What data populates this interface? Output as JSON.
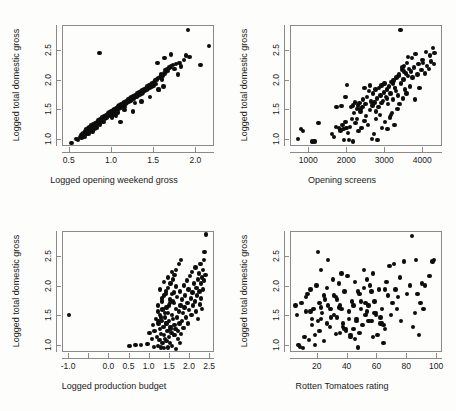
{
  "figure": {
    "type": "scatter-matrix",
    "background_color": "#fdfdfc",
    "point_color": "#0d0d0d",
    "axis_color": "#8a8a8a",
    "rows": 2,
    "cols": 2
  },
  "chart_data": [
    {
      "type": "scatter",
      "panel": 0,
      "title": "",
      "xlabel": "Logged opening weekend gross",
      "ylabel": "Logged total domestic gross",
      "xlim": [
        0.42,
        2.22
      ],
      "ylim": [
        0.88,
        2.92
      ],
      "xticks": [
        0.5,
        1.0,
        1.5,
        2.0
      ],
      "xticklabels": [
        "0.5",
        "1.0",
        "1.5",
        "2.0"
      ],
      "yticks": [
        1.0,
        1.5,
        2.0,
        2.5
      ],
      "yticklabels": [
        "1.0",
        "1.5",
        "2.0",
        "2.5"
      ],
      "grid": false,
      "legend": null,
      "x": [
        0.52,
        0.58,
        0.6,
        0.62,
        0.63,
        0.64,
        0.65,
        0.66,
        0.66,
        0.67,
        0.68,
        0.68,
        0.69,
        0.7,
        0.7,
        0.71,
        0.72,
        0.72,
        0.73,
        0.74,
        0.75,
        0.75,
        0.76,
        0.77,
        0.78,
        0.78,
        0.79,
        0.8,
        0.8,
        0.81,
        0.82,
        0.82,
        0.83,
        0.84,
        0.85,
        0.86,
        0.86,
        0.87,
        0.88,
        0.89,
        0.9,
        0.91,
        0.92,
        0.93,
        0.94,
        0.95,
        0.96,
        0.97,
        0.98,
        0.99,
        1.0,
        1.0,
        1.01,
        1.02,
        1.03,
        1.03,
        1.04,
        1.05,
        1.05,
        1.06,
        1.07,
        1.07,
        1.08,
        1.09,
        1.1,
        1.1,
        1.11,
        1.12,
        1.13,
        1.14,
        1.15,
        1.15,
        1.16,
        1.17,
        1.18,
        1.19,
        1.2,
        1.21,
        1.22,
        1.23,
        1.24,
        1.25,
        1.26,
        1.27,
        1.28,
        1.29,
        1.3,
        1.31,
        1.32,
        1.33,
        1.34,
        1.35,
        1.36,
        1.37,
        1.38,
        1.39,
        1.4,
        1.41,
        1.42,
        1.43,
        1.44,
        1.45,
        1.46,
        1.47,
        1.48,
        1.49,
        1.5,
        1.51,
        1.52,
        1.53,
        1.54,
        1.55,
        1.56,
        1.57,
        1.58,
        1.59,
        1.6,
        1.61,
        1.62,
        1.63,
        1.64,
        1.65,
        1.66,
        1.68,
        1.7,
        1.72,
        1.74,
        1.76,
        1.78,
        1.8,
        1.82,
        1.85,
        1.88,
        1.9,
        1.92,
        2.05,
        2.15,
        0.85,
        0.95,
        1.05,
        1.15,
        1.25,
        1.35,
        1.45,
        1.55,
        1.62,
        1.7
      ],
      "y": [
        0.95,
        1.02,
        1.0,
        1.05,
        1.08,
        1.03,
        1.1,
        1.06,
        1.12,
        1.08,
        1.14,
        1.05,
        1.16,
        1.1,
        1.18,
        1.13,
        1.2,
        1.11,
        1.22,
        1.16,
        1.18,
        1.24,
        1.2,
        1.14,
        1.22,
        1.26,
        1.24,
        1.19,
        1.28,
        1.25,
        1.21,
        1.3,
        1.27,
        1.33,
        1.29,
        1.35,
        1.26,
        1.31,
        1.38,
        1.34,
        1.3,
        1.4,
        1.36,
        1.42,
        1.38,
        1.44,
        1.4,
        1.46,
        1.42,
        1.48,
        1.44,
        1.38,
        1.5,
        1.46,
        1.52,
        1.42,
        1.48,
        1.54,
        1.44,
        1.5,
        1.56,
        1.46,
        1.52,
        1.58,
        1.54,
        1.3,
        1.6,
        1.56,
        1.62,
        1.58,
        1.64,
        1.5,
        1.6,
        1.66,
        1.62,
        1.68,
        1.64,
        1.7,
        1.66,
        1.72,
        1.68,
        1.74,
        1.7,
        1.62,
        1.76,
        1.72,
        1.78,
        1.74,
        1.8,
        1.76,
        1.82,
        1.78,
        1.84,
        1.8,
        1.86,
        1.82,
        1.88,
        1.84,
        1.9,
        1.86,
        1.92,
        1.88,
        1.94,
        1.9,
        1.96,
        1.92,
        1.98,
        2.0,
        1.94,
        2.02,
        2.3,
        2.04,
        1.84,
        2.06,
        2.1,
        2.02,
        2.08,
        1.9,
        2.12,
        2.18,
        2.14,
        2.2,
        2.16,
        2.22,
        2.24,
        2.26,
        2.2,
        2.28,
        2.1,
        2.3,
        2.24,
        2.35,
        2.42,
        2.85,
        2.4,
        2.26,
        2.58,
        2.46,
        1.45,
        1.4,
        1.55,
        1.48,
        1.65,
        1.72,
        1.85,
        2.38,
        2.44,
        2.32
      ]
    },
    {
      "type": "scatter",
      "panel": 1,
      "title": "",
      "xlabel": "Opening screens",
      "ylabel": "Logged total domestic gross",
      "xlim": [
        520,
        4520
      ],
      "ylim": [
        0.88,
        2.92
      ],
      "xticks": [
        1000,
        2000,
        3000,
        4000
      ],
      "xticklabels": [
        "1000",
        "2000",
        "3000",
        "4000"
      ],
      "yticks": [
        1.0,
        1.5,
        2.0,
        2.5
      ],
      "yticklabels": [
        "1.0",
        "1.5",
        "2.0",
        "2.5"
      ],
      "grid": false,
      "legend": null,
      "x": [
        700,
        780,
        830,
        1080,
        1100,
        1120,
        1150,
        1240,
        1600,
        1650,
        1700,
        1720,
        1780,
        1820,
        1850,
        1880,
        1900,
        1920,
        1950,
        1980,
        2000,
        2020,
        2050,
        2080,
        2100,
        2120,
        2150,
        2180,
        2200,
        2220,
        2250,
        2280,
        2300,
        2320,
        2350,
        2380,
        2400,
        2420,
        2450,
        2480,
        2500,
        2520,
        2550,
        2580,
        2600,
        2620,
        2650,
        2660,
        2680,
        2700,
        2720,
        2740,
        2760,
        2780,
        2800,
        2820,
        2840,
        2860,
        2880,
        2900,
        2920,
        2940,
        2960,
        2980,
        3000,
        3020,
        3040,
        3060,
        3080,
        3100,
        3120,
        3140,
        3160,
        3180,
        3200,
        3220,
        3240,
        3260,
        3280,
        3300,
        3320,
        3340,
        3360,
        3380,
        3400,
        3420,
        3440,
        3460,
        3480,
        3500,
        3520,
        3540,
        3560,
        3580,
        3600,
        3620,
        3650,
        3680,
        3700,
        3720,
        3750,
        3780,
        3800,
        3850,
        3880,
        3900,
        3950,
        3980,
        4000,
        4050,
        4080,
        4100,
        4150,
        4180,
        4200,
        4250,
        4280,
        4300,
        2600,
        2750,
        2900,
        3050,
        3200,
        3350,
        3500,
        2450,
        2350,
        2250,
        3150,
        3250,
        3450,
        3600,
        1950,
        2150
      ],
      "y": [
        1.02,
        1.18,
        1.15,
        0.97,
        0.96,
        0.98,
        0.97,
        1.28,
        1.1,
        1.05,
        1.22,
        1.55,
        1.2,
        1.16,
        1.57,
        1.25,
        1.18,
        1.0,
        1.3,
        1.2,
        1.93,
        1.12,
        1.0,
        1.22,
        1.55,
        1.35,
        0.97,
        1.45,
        1.63,
        1.28,
        1.52,
        1.58,
        1.15,
        1.62,
        1.48,
        1.2,
        1.55,
        1.68,
        1.32,
        1.6,
        1.4,
        1.72,
        1.25,
        1.82,
        1.5,
        1.65,
        1.02,
        1.58,
        1.78,
        1.1,
        1.63,
        1.85,
        1.35,
        1.7,
        1.0,
        1.55,
        1.88,
        1.42,
        1.75,
        1.92,
        1.2,
        1.66,
        1.8,
        1.95,
        1.3,
        1.72,
        1.85,
        1.18,
        1.6,
        1.9,
        1.38,
        1.78,
        1.98,
        1.45,
        1.68,
        2.0,
        1.25,
        1.88,
        1.82,
        2.05,
        1.52,
        1.75,
        2.1,
        1.6,
        2.85,
        1.95,
        2.18,
        1.7,
        2.02,
        2.25,
        1.85,
        2.12,
        1.78,
        2.3,
        2.08,
        2.2,
        1.9,
        2.15,
        2.38,
        2.05,
        2.22,
        1.68,
        2.45,
        2.1,
        2.28,
        1.88,
        2.18,
        2.35,
        2.3,
        2.12,
        2.48,
        2.25,
        2.2,
        2.42,
        2.32,
        2.55,
        2.28,
        2.46,
        1.92,
        1.48,
        1.62,
        1.7,
        1.95,
        2.08,
        2.15,
        1.88,
        1.52,
        1.35,
        1.42,
        1.88,
        2.22,
        2.4,
        1.72,
        1.58
      ]
    },
    {
      "type": "scatter",
      "panel": 2,
      "title": "",
      "xlabel": "Logged production budget",
      "ylabel": "Logged total domestic gross",
      "xlim": [
        -1.15,
        2.62
      ],
      "ylim": [
        0.88,
        2.92
      ],
      "xticks": [
        -1.0,
        -0.5,
        0.0,
        0.5,
        1.0,
        1.5,
        2.0,
        2.5
      ],
      "xticklabels": [
        "-1.0",
        "",
        "0.0",
        "0.5",
        "1.0",
        "1.5",
        "2.0",
        "2.5"
      ],
      "yticks": [
        1.0,
        1.5,
        2.0,
        2.5
      ],
      "yticklabels": [
        "1.0",
        "1.5",
        "2.0",
        "2.5"
      ],
      "grid": false,
      "legend": null,
      "x": [
        -1.0,
        0.5,
        0.65,
        0.78,
        0.95,
        1.0,
        1.05,
        1.08,
        1.1,
        1.12,
        1.15,
        1.18,
        1.2,
        1.2,
        1.22,
        1.24,
        1.25,
        1.26,
        1.28,
        1.28,
        1.3,
        1.3,
        1.32,
        1.32,
        1.34,
        1.35,
        1.35,
        1.36,
        1.38,
        1.38,
        1.4,
        1.4,
        1.42,
        1.42,
        1.44,
        1.45,
        1.45,
        1.46,
        1.48,
        1.48,
        1.5,
        1.5,
        1.52,
        1.52,
        1.54,
        1.55,
        1.55,
        1.56,
        1.58,
        1.58,
        1.6,
        1.6,
        1.62,
        1.62,
        1.64,
        1.65,
        1.65,
        1.66,
        1.68,
        1.68,
        1.7,
        1.7,
        1.72,
        1.72,
        1.74,
        1.75,
        1.75,
        1.76,
        1.78,
        1.78,
        1.8,
        1.8,
        1.82,
        1.84,
        1.85,
        1.86,
        1.88,
        1.9,
        1.92,
        1.94,
        1.95,
        1.96,
        1.98,
        2.0,
        2.02,
        2.04,
        2.05,
        2.06,
        2.08,
        2.1,
        2.12,
        2.14,
        2.15,
        2.16,
        2.18,
        2.2,
        2.2,
        2.22,
        2.24,
        2.25,
        2.26,
        2.28,
        2.28,
        2.3,
        2.3,
        2.32,
        2.32,
        2.34,
        2.35,
        2.36,
        2.38,
        2.4,
        1.25,
        1.3,
        1.35,
        1.4,
        1.45,
        1.5,
        1.55,
        1.6,
        1.65,
        1.2,
        1.22,
        1.28,
        1.32,
        1.38,
        1.42,
        1.48,
        1.52,
        1.58,
        1.62,
        1.68
      ],
      "y": [
        1.52,
        1.0,
        1.02,
        1.02,
        1.03,
        1.22,
        1.12,
        1.35,
        0.98,
        1.25,
        1.45,
        1.15,
        1.0,
        1.68,
        1.38,
        1.1,
        1.52,
        1.28,
        0.97,
        1.2,
        1.42,
        1.75,
        1.05,
        1.6,
        1.32,
        0.96,
        1.18,
        1.85,
        1.48,
        1.12,
        1.38,
        1.92,
        1.08,
        1.65,
        1.25,
        0.97,
        1.55,
        1.98,
        1.42,
        1.15,
        1.05,
        1.78,
        1.32,
        2.05,
        1.22,
        1.0,
        1.88,
        1.52,
        1.45,
        2.12,
        1.18,
        1.72,
        1.35,
        2.2,
        1.28,
        0.95,
        1.62,
        2.28,
        1.48,
        1.82,
        1.12,
        1.25,
        1.58,
        2.38,
        1.38,
        1.05,
        1.92,
        1.68,
        1.2,
        2.45,
        1.42,
        1.78,
        1.55,
        1.3,
        2.02,
        1.65,
        1.85,
        1.48,
        2.1,
        1.72,
        1.38,
        1.95,
        1.6,
        2.18,
        1.8,
        1.52,
        2.25,
        1.9,
        1.68,
        2.05,
        1.75,
        2.32,
        1.58,
        1.98,
        1.85,
        1.45,
        2.12,
        2.22,
        1.92,
        1.7,
        2.38,
        1.8,
        2.05,
        1.62,
        2.15,
        2.28,
        1.95,
        2.45,
        2.1,
        2.58,
        2.2,
        2.88,
        1.95,
        1.8,
        2.08,
        1.88,
        2.15,
        1.72,
        2.25,
        1.9,
        2.0,
        1.58,
        1.42,
        1.48,
        1.62,
        1.55,
        1.38,
        1.68,
        1.28,
        1.75,
        1.18
      ]
    },
    {
      "type": "scatter",
      "panel": 3,
      "title": "",
      "xlabel": "Rotten Tomatoes rating",
      "ylabel": "Logged total domestic gross",
      "xlim": [
        2,
        104
      ],
      "ylim": [
        0.88,
        2.92
      ],
      "xticks": [
        20,
        40,
        60,
        80,
        100
      ],
      "xticklabels": [
        "20",
        "40",
        "60",
        "80",
        "100"
      ],
      "yticks": [
        1.0,
        1.5,
        2.0,
        2.5
      ],
      "yticklabels": [
        "1.0",
        "1.5",
        "2.0",
        "2.5"
      ],
      "grid": false,
      "legend": null,
      "x": [
        5,
        6,
        7,
        8,
        9,
        10,
        11,
        12,
        13,
        14,
        15,
        16,
        17,
        18,
        19,
        20,
        20,
        21,
        22,
        23,
        24,
        25,
        26,
        27,
        28,
        29,
        30,
        31,
        32,
        33,
        34,
        35,
        36,
        37,
        38,
        39,
        40,
        41,
        42,
        43,
        44,
        45,
        46,
        47,
        48,
        49,
        50,
        51,
        52,
        53,
        54,
        55,
        56,
        57,
        58,
        59,
        60,
        61,
        62,
        63,
        64,
        65,
        66,
        67,
        68,
        69,
        70,
        71,
        72,
        73,
        74,
        75,
        76,
        78,
        80,
        82,
        83,
        84,
        85,
        86,
        87,
        88,
        89,
        90,
        91,
        92,
        95,
        97,
        98,
        12,
        16,
        22,
        26,
        31,
        35,
        38,
        42,
        46,
        52,
        56,
        58,
        62,
        64,
        22,
        28,
        33,
        37,
        44,
        48,
        53,
        57,
        63,
        18,
        24,
        29,
        34,
        39,
        45,
        49,
        54,
        59,
        65,
        15,
        21,
        27,
        32,
        36,
        41,
        47,
        51
      ],
      "y": [
        1.68,
        1.52,
        1.02,
        0.98,
        1.72,
        0.96,
        1.15,
        1.58,
        1.88,
        1.1,
        1.95,
        1.35,
        1.62,
        1.18,
        2.02,
        2.58,
        1.42,
        1.25,
        2.28,
        1.55,
        1.08,
        1.78,
        1.98,
        2.45,
        1.32,
        1.62,
        2.12,
        1.85,
        1.2,
        1.48,
        2.05,
        1.68,
        2.22,
        1.38,
        1.92,
        1.25,
        2.18,
        1.58,
        1.15,
        1.75,
        1.28,
        2.08,
        1.45,
        0.97,
        1.88,
        1.62,
        1.35,
        1.98,
        1.52,
        2.12,
        1.68,
        2.02,
        1.42,
        2.22,
        1.75,
        1.55,
        1.18,
        1.95,
        1.38,
        1.62,
        1.05,
        1.28,
        2.08,
        1.85,
        2.35,
        1.52,
        1.72,
        2.38,
        1.95,
        1.62,
        1.82,
        2.15,
        1.42,
        2.42,
        1.88,
        2.02,
        2.85,
        1.32,
        1.55,
        2.45,
        1.88,
        1.18,
        1.72,
        2.05,
        1.62,
        2.02,
        2.18,
        2.42,
        2.45,
        1.82,
        1.45,
        1.65,
        1.38,
        1.52,
        1.22,
        1.28,
        1.18,
        1.42,
        1.72,
        1.92,
        1.55,
        1.48,
        1.35,
        1.45,
        1.62,
        1.78,
        1.32,
        1.68,
        1.22,
        1.58,
        1.15,
        1.38,
        1.02,
        1.85,
        1.48,
        1.65,
        1.28,
        1.12,
        1.75,
        1.42,
        1.52,
        1.95,
        1.58,
        1.72,
        1.68,
        1.82,
        1.62,
        1.45,
        1.92,
        2.28,
        1.35
      ]
    }
  ]
}
